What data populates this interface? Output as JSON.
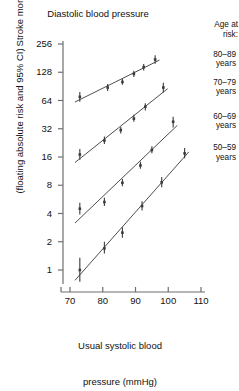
{
  "chart_data": {
    "type": "line",
    "title": "Diastolic blood pressure",
    "xlabel_line1": "Usual systolic blood",
    "xlabel_line2": "pressure (mmHg)",
    "ylabel_line1": "Stroke mortality",
    "ylabel_line2": "(floating absolute risk and 95% CI)",
    "xlim": [
      66,
      114
    ],
    "ylim": [
      0.55,
      300
    ],
    "yscale": "log2",
    "xticks": [
      70,
      80,
      90,
      100,
      110
    ],
    "yticks": [
      1,
      2,
      4,
      8,
      16,
      32,
      64,
      128,
      256
    ],
    "grid": false,
    "legend_position": "right",
    "legend_title_line1": "Age at",
    "legend_title_line2": "risk:",
    "series": [
      {
        "name": "80-89 years",
        "label_line1": "80–89",
        "label_line2": "years",
        "color": "#3b3b3b",
        "points": [
          {
            "x": 73.0,
            "y": 70.0,
            "lo": 62.0,
            "hi": 79.0
          },
          {
            "x": 81.5,
            "y": 88.0,
            "lo": 81.0,
            "hi": 96.0
          },
          {
            "x": 86.0,
            "y": 101.0,
            "lo": 94.0,
            "hi": 109.0
          },
          {
            "x": 89.5,
            "y": 123.0,
            "lo": 114.0,
            "hi": 133.0
          },
          {
            "x": 92.5,
            "y": 145.0,
            "lo": 134.0,
            "hi": 157.0
          },
          {
            "x": 96.0,
            "y": 175.0,
            "lo": 158.0,
            "hi": 194.0
          }
        ]
      },
      {
        "name": "70-79 years",
        "label_line1": "70–79",
        "label_line2": "years",
        "color": "#3b3b3b",
        "points": [
          {
            "x": 73.0,
            "y": 17.0,
            "lo": 15.0,
            "hi": 19.5
          },
          {
            "x": 80.5,
            "y": 24.0,
            "lo": 22.0,
            "hi": 26.5
          },
          {
            "x": 85.5,
            "y": 31.0,
            "lo": 28.5,
            "hi": 33.5
          },
          {
            "x": 89.5,
            "y": 41.0,
            "lo": 38.0,
            "hi": 45.0
          },
          {
            "x": 93.0,
            "y": 55.0,
            "lo": 50.0,
            "hi": 60.0
          },
          {
            "x": 98.5,
            "y": 88.0,
            "lo": 78.0,
            "hi": 99.0
          }
        ]
      },
      {
        "name": "60-69 years",
        "label_line1": "60–69",
        "label_line2": "years",
        "color": "#3b3b3b",
        "points": [
          {
            "x": 73.0,
            "y": 4.5,
            "lo": 3.9,
            "hi": 5.2
          },
          {
            "x": 80.5,
            "y": 5.3,
            "lo": 4.8,
            "hi": 5.9
          },
          {
            "x": 86.0,
            "y": 8.5,
            "lo": 7.8,
            "hi": 9.3
          },
          {
            "x": 91.5,
            "y": 13.0,
            "lo": 12.0,
            "hi": 14.2
          },
          {
            "x": 95.0,
            "y": 19.0,
            "lo": 17.5,
            "hi": 20.8
          },
          {
            "x": 101.5,
            "y": 38.0,
            "lo": 33.0,
            "hi": 43.0
          }
        ]
      },
      {
        "name": "50-59 years",
        "label_line1": "50–59",
        "label_line2": "years",
        "color": "#3b3b3b",
        "points": [
          {
            "x": 73.0,
            "y": 1.0,
            "lo": 0.75,
            "hi": 1.35
          },
          {
            "x": 80.5,
            "y": 1.7,
            "lo": 1.5,
            "hi": 2.0
          },
          {
            "x": 86.0,
            "y": 2.5,
            "lo": 2.2,
            "hi": 2.85
          },
          {
            "x": 92.0,
            "y": 4.8,
            "lo": 4.3,
            "hi": 5.4
          },
          {
            "x": 98.0,
            "y": 8.6,
            "lo": 7.6,
            "hi": 9.8
          },
          {
            "x": 105.0,
            "y": 17.5,
            "lo": 15.5,
            "hi": 20.0
          }
        ]
      }
    ]
  }
}
